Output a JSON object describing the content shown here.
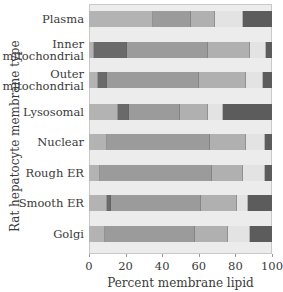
{
  "chart_data": {
    "type": "bar",
    "orientation": "horizontal",
    "stacked": true,
    "title": "",
    "xlabel": "Percent membrane lipid",
    "ylabel": "Rat hepatocyte membrane type",
    "xlim": [
      0,
      100
    ],
    "xticks": [
      0,
      20,
      40,
      60,
      80,
      100
    ],
    "grid": false,
    "legend": null,
    "categories": [
      "Plasma",
      "Inner mitochondrial",
      "Outer mitochondrial",
      "Lysosomal",
      "Nuclear",
      "Rough ER",
      "Smooth ER",
      "Golgi"
    ],
    "segment_colors": [
      "#b3b3b3",
      "#6a6a6a",
      "#9b9b9b",
      "#b0b0b0",
      "#e3e3e3",
      "#5c5c5c"
    ],
    "series": [
      {
        "name": "segment 1",
        "color": "#b3b3b3",
        "values": [
          35,
          3,
          5,
          16,
          10,
          6,
          10,
          9
        ]
      },
      {
        "name": "segment 2 (dark)",
        "color": "#6a6a6a",
        "values": [
          0,
          18,
          5,
          6,
          0,
          0,
          2,
          0
        ]
      },
      {
        "name": "segment 3",
        "color": "#9b9b9b",
        "values": [
          21,
          44,
          50,
          28,
          56,
          61,
          49,
          49
        ]
      },
      {
        "name": "segment 4",
        "color": "#b0b0b0",
        "values": [
          13,
          23,
          26,
          15,
          20,
          17,
          20,
          18
        ]
      },
      {
        "name": "segment 5 (light)",
        "color": "#e3e3e3",
        "values": [
          15,
          9,
          9,
          8,
          10,
          12,
          6,
          12
        ]
      },
      {
        "name": "segment 6 (darkest)",
        "color": "#5c5c5c",
        "values": [
          16,
          3,
          5,
          27,
          4,
          4,
          13,
          12
        ]
      }
    ]
  },
  "labels": {
    "categories": [
      "Plasma",
      "Inner\nmitochondrial",
      "Outer\nmitochondrial",
      "Lysosomal",
      "Nuclear",
      "Rough ER",
      "Smooth ER",
      "Golgi"
    ],
    "xlabel": "Percent membrane lipid",
    "ylabel": "Rat hepatocyte membrane type",
    "ticks": [
      "0",
      "20",
      "40",
      "60",
      "80",
      "100"
    ]
  }
}
